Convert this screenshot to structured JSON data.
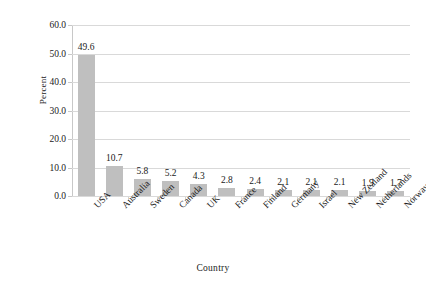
{
  "chart_data": {
    "type": "bar",
    "title": "",
    "xlabel": "Country",
    "ylabel": "Percent",
    "categories": [
      "USA",
      "Australia",
      "Sweden",
      "Canada",
      "UK",
      "France",
      "Finland",
      "Germany",
      "Israel",
      "New Zealand",
      "Netherlands",
      "Norway"
    ],
    "values": [
      49.6,
      10.7,
      5.8,
      5.2,
      4.3,
      2.8,
      2.4,
      2.1,
      2.1,
      2.1,
      1.9,
      1.7
    ],
    "value_labels": [
      "49.6",
      "10.7",
      "5.8",
      "5.2",
      "4.3",
      "2.8",
      "2.4",
      "2.1",
      "2.1",
      "2.1",
      "1.9",
      "1.7"
    ],
    "ylim": [
      0.0,
      60.0
    ],
    "ytick_values": [
      60.0,
      50.0,
      40.0,
      30.0,
      20.0,
      10.0,
      0.0
    ],
    "ytick_labels": [
      "60.0",
      "50.0",
      "40.0",
      "30.0",
      "20.0",
      "10.0",
      "0.0"
    ],
    "grid": true,
    "grid_axis": "y",
    "legend": false,
    "legend_position": "none",
    "bar_color": "#bfbfbf",
    "gridline_color": "#d9d9d9",
    "axis_color": "#c8c8c8",
    "background_color": "#ffffff",
    "text_color": "#1a1a1a",
    "category_label_rotation": -45,
    "data_labels_shown": true
  }
}
